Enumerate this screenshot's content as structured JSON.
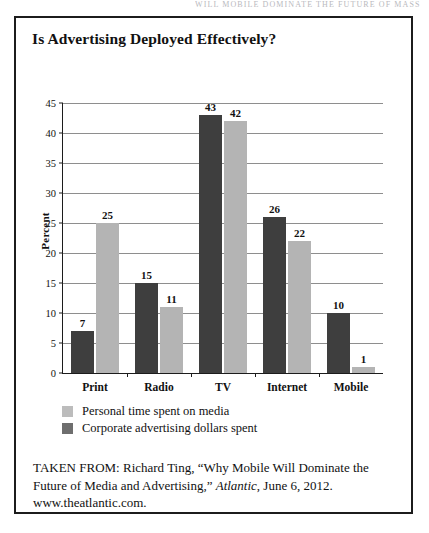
{
  "page": {
    "running_head": "WILL MOBILE DOMINATE THE FUTURE OF MASS MEDIA"
  },
  "figure": {
    "title": "Is Advertising Deployed Effectively?",
    "source_prefix": "TAKEN FROM:",
    "source_author": "Richard Ting,",
    "source_article": "“Why Mobile Will Dominate the Future of Media and Advertising,”",
    "source_publication": "Atlantic",
    "source_date": ", June 6, 2012.",
    "source_url": "www.theatlantic.com.",
    "source_full": "TAKEN FROM: Richard Ting, “Why Mobile Will Dominate the Future of Media and Advertising,” Atlantic, June 6, 2012. www.theatlantic.com."
  },
  "colors": {
    "bar_dark": "#3e3e3e",
    "bar_light": "#b4b4b4",
    "legend_dark": "#6e6e6e",
    "legend_light": "#bcbcbc",
    "frame": "#1c1c1c",
    "grid": "#8e8e8e",
    "background": "#ffffff"
  },
  "chart_data": {
    "type": "bar",
    "title": "Is Advertising Deployed Effectively?",
    "xlabel": "",
    "ylabel": "Percent",
    "ylim": [
      0,
      45
    ],
    "ytick_step": 5,
    "yticks": [
      0,
      5,
      10,
      15,
      20,
      25,
      30,
      35,
      40,
      45
    ],
    "ytick_labels": [
      "0",
      "5",
      "10",
      "15",
      "20",
      "25",
      "30",
      "35",
      "40",
      "45"
    ],
    "grid": true,
    "grid_axis": "y",
    "legend_position": "below-plot-left",
    "categories": [
      "Print",
      "Radio",
      "TV",
      "Internet",
      "Mobile"
    ],
    "series": [
      {
        "name": "Corporate advertising dollars spent",
        "color": "#3e3e3e",
        "values": [
          7,
          15,
          43,
          26,
          10
        ],
        "labels": [
          "7",
          "15",
          "43",
          "26",
          "10"
        ]
      },
      {
        "name": "Personal time spent on media",
        "color": "#b4b4b4",
        "values": [
          25,
          11,
          42,
          22,
          1
        ],
        "labels": [
          "25",
          "11",
          "42",
          "22",
          "1"
        ]
      }
    ]
  }
}
